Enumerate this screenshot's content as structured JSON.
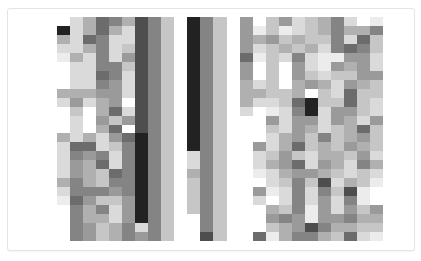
{
  "image": {
    "description": "grayscale pixel grid",
    "grid": {
      "cols": 25,
      "rows": 25,
      "scale": "0 = white, 9 = near-black",
      "palette": [
        "#ffffff",
        "#ececec",
        "#dadada",
        "#c6c6c6",
        "#b0b0b0",
        "#9a9a9a",
        "#848484",
        "#6c6c6c",
        "#4e4e4e",
        "#222222"
      ],
      "cells": [
        [
          0,
          2,
          4,
          7,
          6,
          4,
          8,
          6,
          3,
          0,
          9,
          6,
          3,
          0,
          5,
          0,
          3,
          5,
          2,
          3,
          4,
          6,
          2,
          0,
          1
        ],
        [
          9,
          2,
          4,
          7,
          4,
          2,
          8,
          6,
          3,
          0,
          9,
          6,
          3,
          0,
          5,
          1,
          3,
          1,
          2,
          3,
          4,
          6,
          4,
          4,
          6
        ],
        [
          4,
          2,
          7,
          6,
          2,
          2,
          8,
          6,
          3,
          0,
          9,
          6,
          3,
          0,
          5,
          4,
          5,
          3,
          4,
          3,
          3,
          6,
          2,
          7,
          3
        ],
        [
          2,
          2,
          4,
          6,
          2,
          3,
          8,
          6,
          3,
          0,
          9,
          6,
          3,
          0,
          5,
          2,
          3,
          4,
          3,
          4,
          2,
          6,
          7,
          6,
          3
        ],
        [
          1,
          4,
          2,
          6,
          2,
          5,
          8,
          6,
          3,
          0,
          9,
          6,
          3,
          0,
          7,
          1,
          3,
          2,
          6,
          2,
          1,
          1,
          5,
          5,
          2
        ],
        [
          0,
          2,
          2,
          6,
          6,
          3,
          8,
          6,
          3,
          0,
          9,
          6,
          3,
          0,
          5,
          0,
          3,
          0,
          5,
          2,
          1,
          5,
          4,
          5,
          2
        ],
        [
          0,
          2,
          2,
          7,
          6,
          2,
          8,
          6,
          3,
          0,
          9,
          6,
          3,
          0,
          5,
          0,
          3,
          0,
          5,
          3,
          2,
          3,
          3,
          5,
          5
        ],
        [
          0,
          2,
          2,
          6,
          5,
          2,
          8,
          6,
          3,
          0,
          9,
          6,
          3,
          0,
          4,
          2,
          3,
          0,
          4,
          5,
          4,
          2,
          5,
          4,
          3
        ],
        [
          4,
          4,
          4,
          5,
          5,
          2,
          8,
          6,
          3,
          0,
          9,
          6,
          3,
          0,
          4,
          4,
          3,
          3,
          4,
          0,
          3,
          2,
          7,
          3,
          3
        ],
        [
          2,
          5,
          2,
          4,
          5,
          0,
          8,
          6,
          3,
          0,
          9,
          6,
          3,
          0,
          4,
          2,
          2,
          3,
          7,
          9,
          3,
          3,
          7,
          3,
          2
        ],
        [
          0,
          3,
          0,
          4,
          7,
          2,
          8,
          6,
          3,
          0,
          9,
          6,
          3,
          0,
          2,
          0,
          1,
          2,
          6,
          9,
          2,
          5,
          5,
          3,
          2
        ],
        [
          0,
          2,
          0,
          5,
          3,
          5,
          8,
          6,
          3,
          0,
          9,
          6,
          3,
          0,
          0,
          0,
          5,
          2,
          5,
          5,
          2,
          5,
          4,
          2,
          5
        ],
        [
          0,
          2,
          0,
          4,
          7,
          0,
          8,
          6,
          3,
          0,
          9,
          6,
          3,
          0,
          0,
          0,
          3,
          2,
          5,
          4,
          2,
          3,
          4,
          7,
          3
        ],
        [
          4,
          2,
          4,
          2,
          5,
          7,
          9,
          6,
          3,
          0,
          9,
          6,
          3,
          0,
          0,
          0,
          2,
          4,
          5,
          3,
          6,
          3,
          4,
          5,
          3
        ],
        [
          2,
          7,
          7,
          2,
          3,
          6,
          9,
          6,
          3,
          0,
          9,
          6,
          3,
          0,
          0,
          5,
          2,
          4,
          7,
          3,
          4,
          3,
          5,
          4,
          3
        ],
        [
          2,
          6,
          5,
          6,
          2,
          6,
          9,
          6,
          3,
          0,
          2,
          6,
          3,
          0,
          0,
          2,
          3,
          5,
          3,
          2,
          4,
          4,
          3,
          5,
          2
        ],
        [
          2,
          5,
          4,
          7,
          2,
          6,
          9,
          6,
          3,
          0,
          2,
          6,
          3,
          0,
          0,
          2,
          4,
          5,
          7,
          2,
          5,
          4,
          2,
          6,
          4
        ],
        [
          2,
          5,
          4,
          3,
          7,
          6,
          9,
          6,
          3,
          0,
          4,
          6,
          3,
          0,
          0,
          1,
          2,
          4,
          5,
          5,
          4,
          3,
          2,
          3,
          2
        ],
        [
          4,
          6,
          4,
          3,
          6,
          6,
          9,
          6,
          3,
          0,
          3,
          6,
          3,
          0,
          0,
          0,
          2,
          3,
          6,
          3,
          8,
          2,
          4,
          3,
          1
        ],
        [
          2,
          6,
          6,
          6,
          5,
          6,
          9,
          6,
          3,
          0,
          3,
          6,
          3,
          0,
          0,
          5,
          1,
          2,
          6,
          2,
          6,
          3,
          8,
          1,
          0
        ],
        [
          1,
          7,
          5,
          3,
          3,
          5,
          9,
          6,
          3,
          0,
          3,
          6,
          3,
          0,
          0,
          2,
          0,
          2,
          6,
          2,
          5,
          2,
          6,
          1,
          0
        ],
        [
          0,
          6,
          4,
          6,
          2,
          5,
          9,
          6,
          3,
          0,
          3,
          6,
          3,
          0,
          0,
          0,
          4,
          3,
          6,
          1,
          5,
          2,
          5,
          3,
          5
        ],
        [
          0,
          6,
          4,
          4,
          2,
          5,
          9,
          6,
          3,
          0,
          0,
          6,
          3,
          0,
          0,
          0,
          5,
          6,
          5,
          1,
          5,
          5,
          6,
          4,
          4
        ],
        [
          0,
          6,
          5,
          3,
          4,
          6,
          2,
          6,
          3,
          0,
          0,
          6,
          3,
          0,
          0,
          0,
          3,
          4,
          5,
          8,
          6,
          4,
          4,
          3,
          3
        ],
        [
          0,
          6,
          5,
          3,
          4,
          6,
          5,
          6,
          3,
          0,
          0,
          8,
          3,
          0,
          0,
          7,
          1,
          4,
          6,
          6,
          4,
          3,
          7,
          2,
          1
        ]
      ]
    }
  }
}
